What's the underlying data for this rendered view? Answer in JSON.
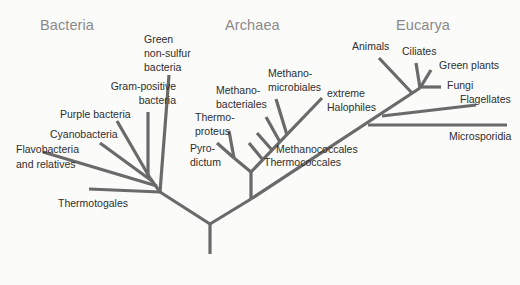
{
  "diagram": {
    "type": "phylogenetic-tree",
    "domains": [
      {
        "name": "Bacteria",
        "x": 40,
        "y": 18
      },
      {
        "name": "Archaea",
        "x": 225,
        "y": 18
      },
      {
        "name": "Eucarya",
        "x": 396,
        "y": 18
      }
    ],
    "labels": {
      "green_nonsulfur": [
        "Green",
        "non-sulfur",
        "bacteria"
      ],
      "gram_positive": [
        "Gram-positive",
        "bacteria"
      ],
      "purple_bacteria": [
        "Purple bacteria"
      ],
      "cyanobacteria": [
        "Cyanobacteria"
      ],
      "flavobacteria": [
        "Flavobacteria",
        "and relatives"
      ],
      "thermotogales": [
        "Thermotogales"
      ],
      "methanomicrobiales": [
        "Methano-",
        "microbiales"
      ],
      "methanobacteriales": [
        "Methano-",
        "bacteriales"
      ],
      "thermoproteus": [
        "Thermo-",
        "proteus"
      ],
      "pyrodictum": [
        "Pyro-",
        "dictum"
      ],
      "methanococcales": [
        "Methanococcales"
      ],
      "thermococcales": [
        "Thermococcales"
      ],
      "extreme_halophiles": [
        "extreme",
        "Halophiles"
      ],
      "animals": [
        "Animals"
      ],
      "ciliates": [
        "Ciliates"
      ],
      "green_plants": [
        "Green plants"
      ],
      "fungi": [
        "Fungi"
      ],
      "flagellates": [
        "Flagellates"
      ],
      "microsporidia": [
        "Microsporidia"
      ]
    },
    "colors": {
      "branch": "#6a6a6a",
      "domain_title": "#8a8a8a",
      "label": "#2e2e2e",
      "background": "#fbfbfa"
    },
    "branches": [
      {
        "name": "root-stem",
        "x1": 210,
        "y1": 254,
        "x2": 210,
        "y2": 224
      },
      {
        "name": "bacteria-stem",
        "x1": 210,
        "y1": 224,
        "x2": 160,
        "y2": 192
      },
      {
        "name": "archaea-eucarya-stem",
        "x1": 210,
        "y1": 224,
        "x2": 251,
        "y2": 199
      },
      {
        "name": "green-nonsulfur-branch",
        "x1": 160,
        "y1": 192,
        "x2": 169,
        "y2": 75
      },
      {
        "name": "thermotogales-branch",
        "x1": 160,
        "y1": 192,
        "x2": 89,
        "y2": 189
      },
      {
        "name": "bacteria-inner",
        "x1": 160,
        "y1": 192,
        "x2": 150,
        "y2": 178
      },
      {
        "name": "flavobacteria-branch",
        "x1": 157,
        "y1": 186,
        "x2": 43,
        "y2": 152
      },
      {
        "name": "cyanobacteria-branch",
        "x1": 152,
        "y1": 181,
        "x2": 100,
        "y2": 143
      },
      {
        "name": "purple-bacteria-branch",
        "x1": 150,
        "y1": 178,
        "x2": 117,
        "y2": 121
      },
      {
        "name": "gram-positive-branch",
        "x1": 148,
        "y1": 178,
        "x2": 148,
        "y2": 112
      },
      {
        "name": "archaea-stem",
        "x1": 251,
        "y1": 199,
        "x2": 251,
        "y2": 172
      },
      {
        "name": "archaea-left",
        "x1": 251,
        "y1": 172,
        "x2": 234,
        "y2": 158
      },
      {
        "name": "pyrodictum-branch",
        "x1": 234,
        "y1": 158,
        "x2": 217,
        "y2": 143
      },
      {
        "name": "thermoproteus-branch",
        "x1": 234,
        "y1": 158,
        "x2": 229,
        "y2": 131
      },
      {
        "name": "halophiles-branch",
        "x1": 251,
        "y1": 172,
        "x2": 322,
        "y2": 98
      },
      {
        "name": "thermococcales-branch",
        "x1": 263,
        "y1": 160,
        "x2": 249,
        "y2": 143
      },
      {
        "name": "methanococcales-branch",
        "x1": 272,
        "y1": 150,
        "x2": 257,
        "y2": 133
      },
      {
        "name": "methanobacteriales-branch",
        "x1": 280,
        "y1": 142,
        "x2": 266,
        "y2": 117
      },
      {
        "name": "methanomicrobiales-branch",
        "x1": 287,
        "y1": 135,
        "x2": 276,
        "y2": 99
      },
      {
        "name": "eucarya-stem",
        "x1": 251,
        "y1": 199,
        "x2": 420,
        "y2": 88
      },
      {
        "name": "microsporidia-branch",
        "x1": 368,
        "y1": 125,
        "x2": 507,
        "y2": 125
      },
      {
        "name": "flagellates-branch",
        "x1": 382,
        "y1": 116,
        "x2": 476,
        "y2": 105
      },
      {
        "name": "animals-branch",
        "x1": 412,
        "y1": 93,
        "x2": 379,
        "y2": 58
      },
      {
        "name": "ciliates-branch",
        "x1": 420,
        "y1": 88,
        "x2": 416,
        "y2": 63
      },
      {
        "name": "green-plants-branch",
        "x1": 420,
        "y1": 88,
        "x2": 431,
        "y2": 70
      },
      {
        "name": "fungi-branch",
        "x1": 420,
        "y1": 87,
        "x2": 441,
        "y2": 87
      }
    ]
  }
}
